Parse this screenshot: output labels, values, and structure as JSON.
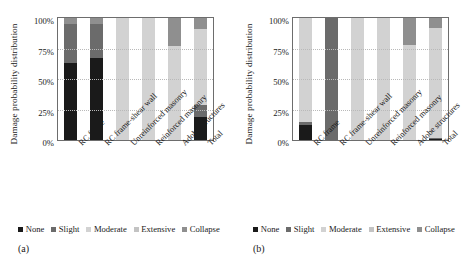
{
  "figure": {
    "panels": [
      {
        "caption": "(a)",
        "ylabel": "Damage probability distribution",
        "yticks": [
          "100%",
          "75%",
          "50%",
          "25%",
          "0%"
        ]
      },
      {
        "caption": "(b)",
        "ylabel": "Damage probability distribution",
        "yticks": [
          "100%",
          "75%",
          "50%",
          "25%",
          "0%"
        ]
      }
    ]
  },
  "colors": {
    "none": "#1a1a1a",
    "slight": "#6b6b6b",
    "moderate": "#d2d2d2",
    "extensive": "#c3c3c3",
    "collapse": "#8f8f8f",
    "axis": "#6d6d6d",
    "grid": "#b9b9b9",
    "text": "#1a1a1a"
  },
  "chart_data": [
    {
      "type": "bar",
      "stacked": true,
      "panel": "(a)",
      "title": "",
      "xlabel": "",
      "ylabel": "Damage probability distribution",
      "ylim": [
        0,
        100
      ],
      "yticks": [
        0,
        25,
        50,
        75,
        100
      ],
      "ytick_labels": [
        "0%",
        "25%",
        "50%",
        "75%",
        "100%"
      ],
      "grid": true,
      "legend_position": "bottom",
      "categories": [
        "RC frame",
        "RC frame-shear wall",
        "Unreinforced masonry",
        "Reinforced masonry",
        "Adobe structures",
        "Total"
      ],
      "series": [
        {
          "name": "None",
          "values": [
            63,
            67,
            0,
            0,
            0,
            19
          ]
        },
        {
          "name": "Slight",
          "values": [
            32,
            28,
            0,
            0,
            0,
            10
          ]
        },
        {
          "name": "Moderate",
          "values": [
            0,
            0,
            100,
            100,
            77,
            62
          ]
        },
        {
          "name": "Extensive",
          "values": [
            0,
            0,
            0,
            0,
            0,
            0
          ]
        },
        {
          "name": "Collapse",
          "values": [
            5,
            5,
            0,
            0,
            23,
            9
          ]
        }
      ]
    },
    {
      "type": "bar",
      "stacked": true,
      "panel": "(b)",
      "title": "",
      "xlabel": "",
      "ylabel": "Damage probability distribution",
      "ylim": [
        0,
        100
      ],
      "yticks": [
        0,
        25,
        50,
        75,
        100
      ],
      "ytick_labels": [
        "0%",
        "25%",
        "50%",
        "75%",
        "100%"
      ],
      "grid": true,
      "legend_position": "bottom",
      "categories": [
        "RC frame",
        "RC frame-shear wall",
        "Unreinforced masonry",
        "Reinforced masonry",
        "Adobe structures",
        "Total"
      ],
      "series": [
        {
          "name": "None",
          "values": [
            12,
            0,
            0,
            0,
            0,
            1
          ]
        },
        {
          "name": "Slight",
          "values": [
            3,
            100,
            0,
            0,
            0,
            1
          ]
        },
        {
          "name": "Moderate",
          "values": [
            85,
            0,
            100,
            100,
            78,
            90
          ]
        },
        {
          "name": "Extensive",
          "values": [
            0,
            0,
            0,
            0,
            0,
            0
          ]
        },
        {
          "name": "Collapse",
          "values": [
            0,
            0,
            0,
            0,
            22,
            8
          ]
        }
      ]
    }
  ],
  "legend": {
    "items": [
      {
        "label": "None",
        "color_key": "none"
      },
      {
        "label": "Slight",
        "color_key": "slight"
      },
      {
        "label": "Moderate",
        "color_key": "moderate"
      },
      {
        "label": "Extensive",
        "color_key": "extensive"
      },
      {
        "label": "Collapse",
        "color_key": "collapse"
      }
    ]
  }
}
